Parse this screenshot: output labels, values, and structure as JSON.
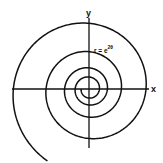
{
  "figure": {
    "axis_x_label": "x",
    "axis_y_label": "y",
    "equation": {
      "base": "r = e",
      "exponent": "2θ"
    }
  },
  "colors": {
    "stroke": "#111111",
    "background": "#ffffff"
  },
  "diagram": {
    "type": "polar-curve",
    "curve": "logarithmic spiral",
    "equation_text": "r = e^(2θ)",
    "origin_px": [
      89,
      89
    ],
    "x_axis_px": [
      12,
      148
    ],
    "y_axis_px": [
      18,
      148
    ],
    "spiral": {
      "a": 57,
      "growth_per_radian": 0.09,
      "theta_start_deg": -1260,
      "theta_end_deg": 240,
      "direction": "counterclockwise outward"
    }
  }
}
